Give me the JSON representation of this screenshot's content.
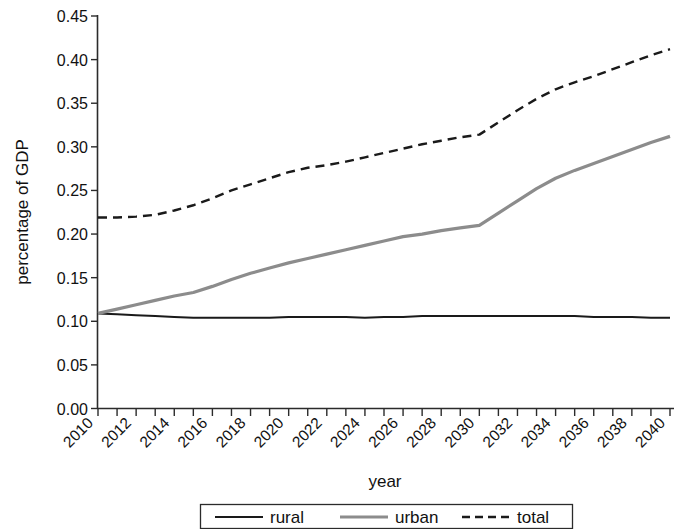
{
  "chart_data": {
    "type": "line",
    "title": "",
    "xlabel": "year",
    "ylabel": "percentage of GDP",
    "xlim": [
      2010,
      2040
    ],
    "ylim": [
      0.0,
      0.45
    ],
    "grid": false,
    "legend_position": "bottom",
    "x_ticks": [
      2010,
      2012,
      2014,
      2016,
      2018,
      2020,
      2022,
      2024,
      2026,
      2028,
      2030,
      2032,
      2034,
      2036,
      2038,
      2040
    ],
    "x_tick_labels": [
      "2010",
      "2012",
      "2014",
      "2016",
      "2018",
      "2020",
      "2022",
      "2024",
      "2026",
      "2028",
      "2030",
      "2032",
      "2034",
      "2036",
      "2038",
      "2040"
    ],
    "y_ticks": [
      0.0,
      0.05,
      0.1,
      0.15,
      0.2,
      0.25,
      0.3,
      0.35,
      0.4,
      0.45
    ],
    "y_tick_labels": [
      "0.00",
      "0.05",
      "0.10",
      "0.15",
      "0.20",
      "0.25",
      "0.30",
      "0.35",
      "0.40",
      "0.45"
    ],
    "x": [
      2010,
      2011,
      2012,
      2013,
      2014,
      2015,
      2016,
      2017,
      2018,
      2019,
      2020,
      2021,
      2022,
      2023,
      2024,
      2025,
      2026,
      2027,
      2028,
      2029,
      2030,
      2031,
      2032,
      2033,
      2034,
      2035,
      2036,
      2037,
      2038,
      2039,
      2040
    ],
    "series": [
      {
        "name": "rural",
        "color": "#1a1a1a",
        "style": "solid",
        "width": 2.0,
        "values": [
          0.109,
          0.108,
          0.107,
          0.106,
          0.105,
          0.104,
          0.104,
          0.104,
          0.104,
          0.104,
          0.105,
          0.105,
          0.105,
          0.105,
          0.104,
          0.105,
          0.105,
          0.106,
          0.106,
          0.106,
          0.106,
          0.106,
          0.106,
          0.106,
          0.106,
          0.106,
          0.105,
          0.105,
          0.105,
          0.104,
          0.104
        ]
      },
      {
        "name": "urban",
        "color": "#8c8c8c",
        "style": "solid",
        "width": 3.2,
        "values": [
          0.109,
          0.114,
          0.119,
          0.124,
          0.129,
          0.133,
          0.14,
          0.148,
          0.155,
          0.161,
          0.167,
          0.172,
          0.177,
          0.182,
          0.187,
          0.192,
          0.197,
          0.2,
          0.204,
          0.207,
          0.21,
          0.224,
          0.238,
          0.252,
          0.264,
          0.273,
          0.281,
          0.289,
          0.297,
          0.305,
          0.312
        ]
      },
      {
        "name": "total",
        "color": "#1a1a1a",
        "style": "dashed",
        "width": 2.4,
        "values": [
          0.219,
          0.219,
          0.22,
          0.222,
          0.227,
          0.233,
          0.241,
          0.25,
          0.257,
          0.264,
          0.271,
          0.276,
          0.279,
          0.283,
          0.288,
          0.293,
          0.298,
          0.303,
          0.307,
          0.311,
          0.314,
          0.328,
          0.342,
          0.355,
          0.366,
          0.374,
          0.381,
          0.389,
          0.397,
          0.405,
          0.412
        ]
      }
    ]
  },
  "legend": {
    "items": [
      {
        "label": "rural",
        "swatch": "solid-black-line"
      },
      {
        "label": "urban",
        "swatch": "solid-gray-line"
      },
      {
        "label": "total",
        "swatch": "dashed-black-line"
      }
    ]
  }
}
